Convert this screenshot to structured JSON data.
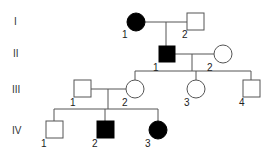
{
  "diagram": {
    "type": "pedigree",
    "colors": {
      "line": "#555555",
      "affected": "#000000",
      "unaffected": "#ffffff"
    },
    "generations": [
      {
        "label": "I",
        "y": 21
      },
      {
        "label": "II",
        "y": 53
      },
      {
        "label": "III",
        "y": 89
      },
      {
        "label": "IV",
        "y": 130
      }
    ],
    "individuals": [
      {
        "id": "I-1",
        "number": "1",
        "sex": "female",
        "affected": true,
        "cx": 136,
        "cy": 22
      },
      {
        "id": "I-2",
        "number": "2",
        "sex": "male",
        "affected": false,
        "cx": 195,
        "cy": 21
      },
      {
        "id": "II-1",
        "number": "1",
        "sex": "male",
        "affected": true,
        "cx": 167,
        "cy": 54
      },
      {
        "id": "II-2",
        "number": "2",
        "sex": "female",
        "affected": false,
        "cx": 223,
        "cy": 54
      },
      {
        "id": "III-1",
        "number": "1",
        "sex": "male",
        "affected": false,
        "cx": 82,
        "cy": 89
      },
      {
        "id": "III-2",
        "number": "2",
        "sex": "female",
        "affected": false,
        "cx": 135,
        "cy": 89
      },
      {
        "id": "III-3",
        "number": "3",
        "sex": "female",
        "affected": false,
        "cx": 196,
        "cy": 89
      },
      {
        "id": "III-4",
        "number": "4",
        "sex": "male",
        "affected": false,
        "cx": 251,
        "cy": 89
      },
      {
        "id": "IV-1",
        "number": "1",
        "sex": "male",
        "affected": false,
        "cx": 54,
        "cy": 130
      },
      {
        "id": "IV-2",
        "number": "2",
        "sex": "male",
        "affected": true,
        "cx": 105,
        "cy": 130
      },
      {
        "id": "IV-3",
        "number": "3",
        "sex": "female",
        "affected": true,
        "cx": 158,
        "cy": 130
      }
    ]
  }
}
